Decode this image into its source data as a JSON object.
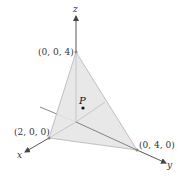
{
  "figure": {
    "type": "3d-coordinate-plane-diagram",
    "axes": {
      "x": {
        "label": "x"
      },
      "y": {
        "label": "y"
      },
      "z": {
        "label": "z"
      }
    },
    "vertices": [
      {
        "id": "z-intercept",
        "label": "(0, 0, 4)"
      },
      {
        "id": "x-intercept",
        "label": "(2, 0, 0)"
      },
      {
        "id": "y-intercept",
        "label": "(0, 4, 0)"
      }
    ],
    "point": {
      "label": "P"
    },
    "colors": {
      "plane_fill": "#e6e6e6",
      "plane_edge": "#b3b3b3",
      "axis": "#555555",
      "point": "#111111"
    }
  }
}
